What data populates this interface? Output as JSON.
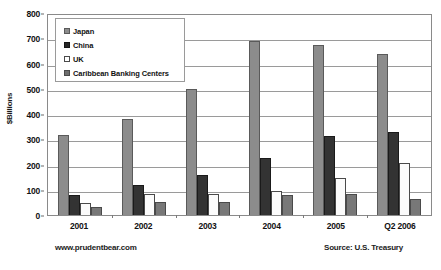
{
  "chart_data": {
    "type": "bar",
    "title": "",
    "xlabel": "",
    "ylabel": "$Billions",
    "ylim": [
      0,
      800
    ],
    "ytick_step": 100,
    "yticks": [
      0,
      100,
      200,
      300,
      400,
      500,
      600,
      700,
      800
    ],
    "grid": true,
    "legend_position": "upper-left-inside",
    "categories": [
      "2001",
      "2002",
      "2003",
      "2004",
      "2005",
      "Q2 2006"
    ],
    "series": [
      {
        "name": "Japan",
        "color": "#8c8c8c",
        "values": [
          317,
          380,
          500,
          690,
          672,
          638
        ]
      },
      {
        "name": "China",
        "color": "#333333",
        "values": [
          78,
          120,
          160,
          225,
          312,
          330
        ]
      },
      {
        "name": "UK",
        "color": "#ffffff",
        "values": [
          47,
          82,
          85,
          95,
          148,
          205
        ]
      },
      {
        "name": "Caribbean Banking Centers",
        "color": "#787878",
        "values": [
          32,
          50,
          52,
          78,
          85,
          65
        ]
      }
    ]
  },
  "legend": {
    "items": [
      {
        "label": "Japan"
      },
      {
        "label": "China"
      },
      {
        "label": "UK"
      },
      {
        "label": "Caribbean Banking Centers"
      }
    ]
  },
  "footer": {
    "left": "www.prudentbear.com",
    "right": "Source: U.S. Treasury"
  }
}
